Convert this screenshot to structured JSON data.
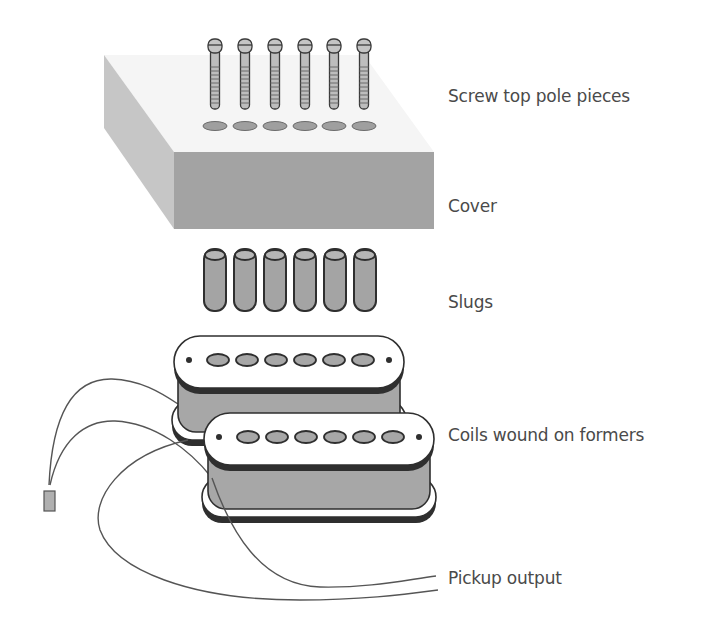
{
  "diagram": {
    "type": "exploded-view",
    "labels": [
      {
        "id": "screws",
        "text": "Screw top pole pieces",
        "x": 448,
        "y": 86
      },
      {
        "id": "cover",
        "text": "Cover",
        "x": 448,
        "y": 196
      },
      {
        "id": "slugs",
        "text": "Slugs",
        "x": 448,
        "y": 292
      },
      {
        "id": "coils",
        "text": "Coils wound on formers",
        "x": 448,
        "y": 425
      },
      {
        "id": "output",
        "text": "Pickup output",
        "x": 448,
        "y": 568
      }
    ],
    "parts": {
      "screw_count": 6,
      "slug_count": 6,
      "coil_count": 2,
      "pole_count_per_coil": 6
    },
    "colors": {
      "part_fill": "#a9a9a9",
      "part_stroke": "#3a3a3a",
      "cover_front": "#a5a5a5",
      "cover_side": "#c8c8c8",
      "cover_top": "#f4f4f4",
      "plate_fill": "#ffffff",
      "wire": "#555555",
      "text": "#4a4a4a"
    }
  }
}
